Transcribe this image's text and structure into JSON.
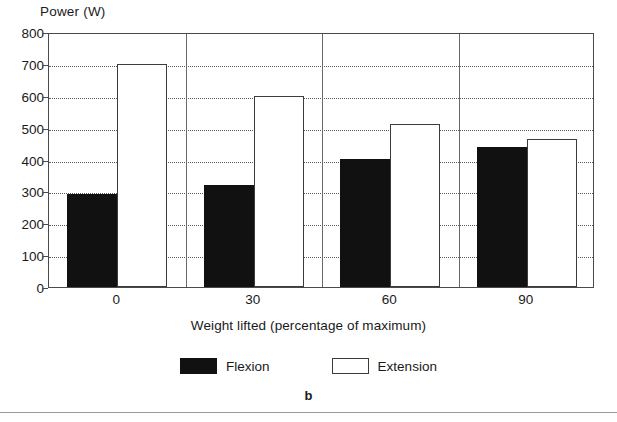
{
  "chart_data": {
    "type": "bar",
    "title": "",
    "subtitle": "",
    "ylabel": "Power (W)",
    "xlabel": "Weight lifted (percentage of maximum)",
    "categories": [
      "0",
      "30",
      "60",
      "90"
    ],
    "ylim": [
      0,
      800
    ],
    "ytick_step": 100,
    "yticks": [
      "800",
      "700",
      "600",
      "500",
      "400",
      "300",
      "200",
      "100",
      "0"
    ],
    "grid": "horizontal-dotted",
    "legend_position": "bottom-center",
    "series": [
      {
        "name": "Flexion",
        "fill": "#111111",
        "values": [
          293,
          320,
          403,
          440
        ]
      },
      {
        "name": "Extension",
        "fill": "#ffffff",
        "values": [
          700,
          600,
          512,
          465
        ]
      }
    ],
    "caption": "b"
  },
  "legend": {
    "items": [
      {
        "label": "Flexion",
        "style": "flexion"
      },
      {
        "label": "Extension",
        "style": "extension"
      }
    ]
  },
  "colors": {
    "flexion_fill": "#111111",
    "extension_fill": "#ffffff",
    "axis": "#4a4a4a",
    "gridline": "#5a5a5a",
    "text": "#1a1a1a"
  }
}
